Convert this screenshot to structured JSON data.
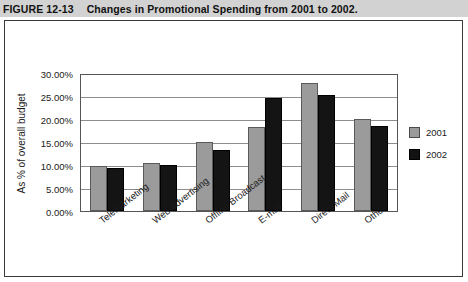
{
  "figure": {
    "label": "FIGURE 12-13",
    "caption": "Changes in Promotional Spending from 2001 to 2002."
  },
  "chart_data": {
    "type": "bar",
    "title": "Changes in Promotional Spending from 2001 to 2002.",
    "xlabel": "",
    "ylabel": "As % of overall budget",
    "categories": [
      "Telemarketing",
      "Web Advertising",
      "Offline Broadcast",
      "E-mail",
      "Direct Mail",
      "Other"
    ],
    "series": [
      {
        "name": "2001",
        "color": "#9b9b9b",
        "values": [
          9.7,
          10.5,
          15.0,
          18.2,
          27.8,
          19.9
        ]
      },
      {
        "name": "2002",
        "color": "#141414",
        "values": [
          9.3,
          10.1,
          13.3,
          24.5,
          25.2,
          18.4
        ]
      }
    ],
    "ylim": [
      0,
      30
    ],
    "ytick_values": [
      0,
      5,
      10,
      15,
      20,
      25,
      30
    ],
    "ytick_labels": [
      "0.00%",
      "5.00%",
      "10.00%",
      "15.00%",
      "20.00%",
      "25.00%",
      "30.00%"
    ],
    "grid": true,
    "legend_position": "right"
  }
}
